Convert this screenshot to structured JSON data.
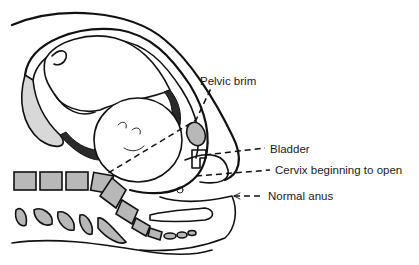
{
  "figure": {
    "labels": [
      {
        "id": "pelvic-brim",
        "text": "Pelvic brim"
      },
      {
        "id": "bladder",
        "text": "Bladder"
      },
      {
        "id": "cervix",
        "text": "Cervix beginning to open"
      },
      {
        "id": "anus",
        "text": "Normal anus"
      }
    ]
  },
  "colors": {
    "ink": "#111111",
    "bone_fill": "#b8b8b8",
    "background": "#ffffff"
  }
}
